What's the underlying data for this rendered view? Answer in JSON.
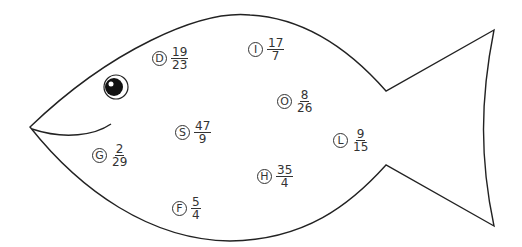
{
  "figure": {
    "outline_color": "#222222",
    "fill_color": "#ffffff"
  },
  "items": [
    {
      "letter": "D",
      "numerator": "19",
      "denominator": "23",
      "x": 152,
      "y": 46
    },
    {
      "letter": "I",
      "numerator": "17",
      "denominator": "7",
      "x": 248,
      "y": 37
    },
    {
      "letter": "O",
      "numerator": "8",
      "denominator": "26",
      "x": 277,
      "y": 89
    },
    {
      "letter": "S",
      "numerator": "47",
      "denominator": "9",
      "x": 175,
      "y": 120
    },
    {
      "letter": "L",
      "numerator": "9",
      "denominator": "15",
      "x": 333,
      "y": 128
    },
    {
      "letter": "G",
      "numerator": "2",
      "denominator": "29",
      "x": 92,
      "y": 143
    },
    {
      "letter": "H",
      "numerator": "35",
      "denominator": "4",
      "x": 257,
      "y": 164
    },
    {
      "letter": "F",
      "numerator": "5",
      "denominator": "4",
      "x": 172,
      "y": 196
    }
  ]
}
